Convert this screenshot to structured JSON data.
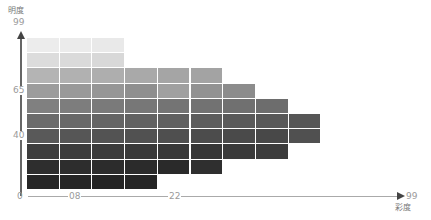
{
  "chart_data": {
    "type": "heatmap",
    "title": "",
    "xlabel": "彩度",
    "ylabel": "明度",
    "y_ticks": [
      "0",
      "40",
      "65",
      "99"
    ],
    "x_ticks": [
      "0",
      "08",
      "22",
      "99"
    ],
    "grid": false,
    "rows": [
      {
        "cells": 3,
        "colors": [
          "#ececec",
          "#ebebeb",
          "#e9e9e9"
        ]
      },
      {
        "cells": 3,
        "colors": [
          "#dcdcdc",
          "#dadada",
          "#d8d8d8"
        ]
      },
      {
        "cells": 6,
        "colors": [
          "#b4b4b4",
          "#b1b1b1",
          "#aeaeae",
          "#a9a9a9",
          "#a5a5a5",
          "#a3a3a3"
        ]
      },
      {
        "cells": 7,
        "colors": [
          "#9c9c9c",
          "#999999",
          "#969696",
          "#8f8f8f",
          "#a0a0a0",
          "#929292",
          "#8c8c8c"
        ]
      },
      {
        "cells": 8,
        "colors": [
          "#808080",
          "#7d7d7d",
          "#7a7a7a",
          "#777777",
          "#747474",
          "#727272",
          "#707070",
          "#6d6d6d"
        ]
      },
      {
        "cells": 9,
        "colors": [
          "#6b6b6b",
          "#686868",
          "#656565",
          "#626262",
          "#606060",
          "#5d5d5d",
          "#5a5a5a",
          "#585858",
          "#565656"
        ]
      },
      {
        "cells": 9,
        "colors": [
          "#595959",
          "#565656",
          "#535353",
          "#515151",
          "#4f4f4f",
          "#4c4c4c",
          "#4a4a4a",
          "#484848",
          "#505050"
        ]
      },
      {
        "cells": 8,
        "colors": [
          "#3e3e3e",
          "#3c3c3c",
          "#3b3b3b",
          "#393939",
          "#383838",
          "#363636",
          "#3a3a3a",
          "#3c3c3c"
        ]
      },
      {
        "cells": 6,
        "colors": [
          "#2e2e2e",
          "#2d2d2d",
          "#2c2c2c",
          "#2b2b2b",
          "#2a2a2a",
          "#2f2f2f"
        ]
      },
      {
        "cells": 4,
        "colors": [
          "#262626",
          "#252525",
          "#242424",
          "#252525"
        ]
      }
    ]
  },
  "axes": {
    "y_label": "明度",
    "y_max": "99",
    "y_mid_high": "65",
    "y_mid_low": "40",
    "origin": "0",
    "x_tick_1": "08",
    "x_tick_2": "22",
    "x_max": "99",
    "x_label": "彩度"
  }
}
